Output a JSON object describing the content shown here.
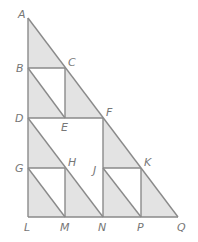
{
  "diagram": {
    "colors": {
      "line": "#8a8a8a",
      "shade": "#e3e3e3",
      "label": "#777777"
    },
    "points": {
      "A": {
        "label": "A",
        "x": 28,
        "y": 18
      },
      "B": {
        "label": "B",
        "x": 28,
        "y": 68
      },
      "C": {
        "label": "C",
        "x": 65,
        "y": 68
      },
      "D": {
        "label": "D",
        "x": 28,
        "y": 118
      },
      "E": {
        "label": "E",
        "x": 65,
        "y": 118
      },
      "F": {
        "label": "F",
        "x": 103,
        "y": 118
      },
      "G": {
        "label": "G",
        "x": 28,
        "y": 168
      },
      "H": {
        "label": "H",
        "x": 65,
        "y": 168
      },
      "J": {
        "label": "J",
        "x": 103,
        "y": 168
      },
      "K": {
        "label": "K",
        "x": 141,
        "y": 168
      },
      "L": {
        "label": "L",
        "x": 28,
        "y": 217
      },
      "M": {
        "label": "M",
        "x": 65,
        "y": 217
      },
      "N": {
        "label": "N",
        "x": 103,
        "y": 217
      },
      "P": {
        "label": "P",
        "x": 141,
        "y": 217
      },
      "Q": {
        "label": "Q",
        "x": 178,
        "y": 217
      }
    },
    "shaded_triangles": [
      [
        "A",
        "B",
        "C"
      ],
      [
        "B",
        "D",
        "E"
      ],
      [
        "C",
        "E",
        "F"
      ],
      [
        "D",
        "G",
        "H"
      ],
      [
        "G",
        "L",
        "M"
      ],
      [
        "H",
        "M",
        "N"
      ],
      [
        "F",
        "J",
        "K"
      ],
      [
        "J",
        "N",
        "P"
      ],
      [
        "K",
        "P",
        "Q"
      ]
    ]
  }
}
